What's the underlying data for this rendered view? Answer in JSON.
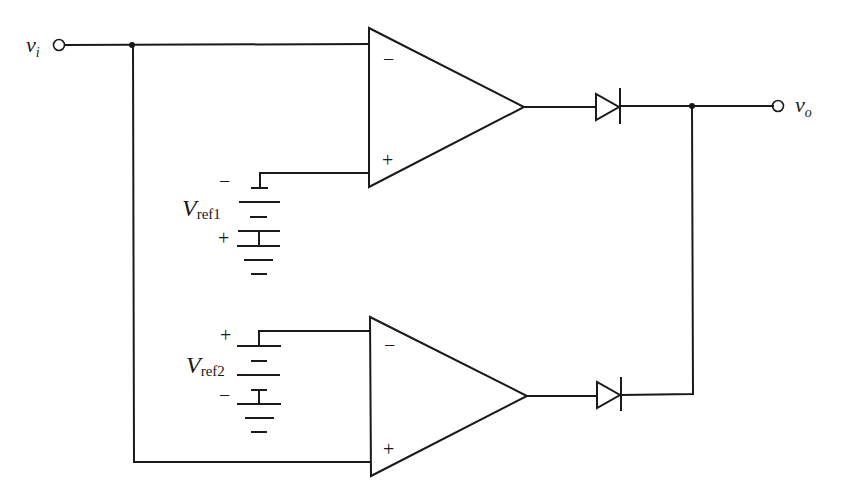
{
  "diagram": {
    "type": "circuit-schematic",
    "terminals": {
      "input": {
        "label_main": "v",
        "label_sub": "i"
      },
      "output": {
        "label_main": "v",
        "label_sub": "o"
      }
    },
    "opamp_top": {
      "inverting_sign": "−",
      "noninverting_sign": "+"
    },
    "opamp_bottom": {
      "inverting_sign": "−",
      "noninverting_sign": "+"
    },
    "battery_top": {
      "label_main": "V",
      "label_sub": "ref1",
      "top_polarity": "−",
      "bottom_polarity": "+"
    },
    "battery_bottom": {
      "label_main": "V",
      "label_sub": "ref2",
      "top_polarity": "+",
      "bottom_polarity": "−"
    },
    "components": [
      "op-amp (top)",
      "op-amp (bottom)",
      "diode D1",
      "diode D2",
      "battery Vref1",
      "battery Vref2"
    ],
    "line_color": "#1a1a1a",
    "background": "#ffffff"
  }
}
